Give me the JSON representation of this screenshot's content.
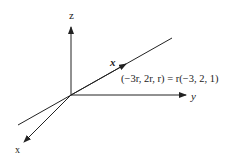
{
  "diagram": {
    "axes": {
      "z_label": "z",
      "y_label": "y",
      "x_label": "x"
    },
    "line": {
      "vector_label": "x",
      "equation": "(−3r, 2r, r) = r(−3, 2, 1)"
    },
    "colors": {
      "stroke": "#222222",
      "background": "#ffffff"
    }
  }
}
